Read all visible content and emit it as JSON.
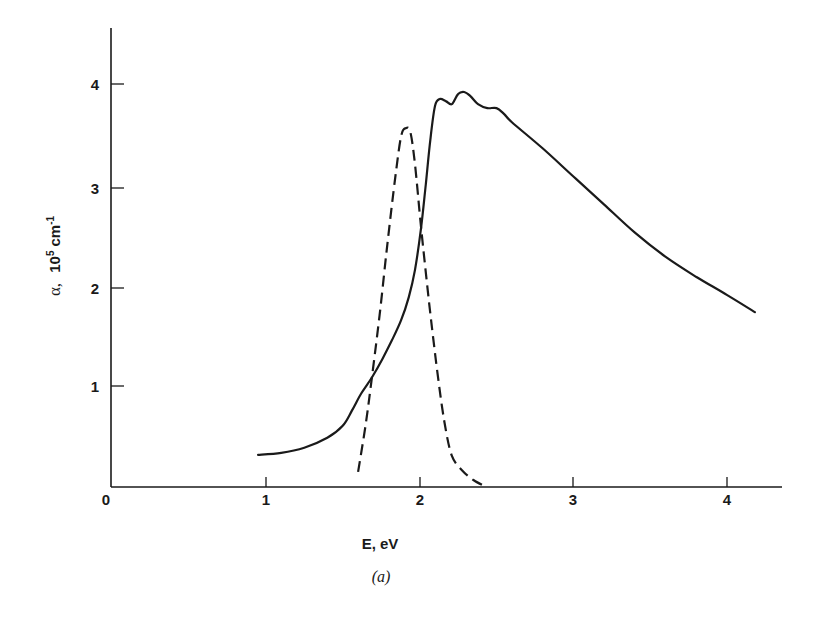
{
  "chart_data": {
    "type": "line",
    "title": "",
    "caption": "(a)",
    "xlabel": "E, eV",
    "ylabel": "α, 10⁵ cm⁻¹",
    "ylabel_parts": {
      "symbol": "α,",
      "base": "10",
      "exp1": "5",
      "unit": "cm",
      "exp2": "-1"
    },
    "xlim": [
      0,
      4.35
    ],
    "ylim": [
      0,
      4.5
    ],
    "x_ticks": [
      "0",
      "1",
      "2",
      "3",
      "4"
    ],
    "y_ticks": [
      "1",
      "2",
      "3",
      "4"
    ],
    "grid": false,
    "legend": null,
    "series": [
      {
        "name": "solid",
        "style": "solid",
        "points": [
          [
            0.95,
            0.31
          ],
          [
            1.1,
            0.33
          ],
          [
            1.25,
            0.38
          ],
          [
            1.4,
            0.48
          ],
          [
            1.5,
            0.6
          ],
          [
            1.56,
            0.75
          ],
          [
            1.62,
            0.92
          ],
          [
            1.69,
            1.08
          ],
          [
            1.76,
            1.27
          ],
          [
            1.82,
            1.45
          ],
          [
            1.88,
            1.65
          ],
          [
            1.93,
            1.88
          ],
          [
            1.97,
            2.15
          ],
          [
            2.01,
            2.57
          ],
          [
            2.04,
            3.0
          ],
          [
            2.07,
            3.45
          ],
          [
            2.1,
            3.78
          ],
          [
            2.13,
            3.85
          ],
          [
            2.17,
            3.83
          ],
          [
            2.21,
            3.8
          ],
          [
            2.25,
            3.9
          ],
          [
            2.29,
            3.92
          ],
          [
            2.33,
            3.88
          ],
          [
            2.38,
            3.8
          ],
          [
            2.44,
            3.76
          ],
          [
            2.5,
            3.76
          ],
          [
            2.55,
            3.7
          ],
          [
            2.6,
            3.62
          ],
          [
            2.8,
            3.36
          ],
          [
            3.0,
            3.08
          ],
          [
            3.2,
            2.8
          ],
          [
            3.4,
            2.52
          ],
          [
            3.6,
            2.28
          ],
          [
            3.8,
            2.08
          ],
          [
            4.0,
            1.9
          ],
          [
            4.18,
            1.73
          ]
        ]
      },
      {
        "name": "dashed",
        "style": "dashed",
        "points": [
          [
            1.6,
            0.14
          ],
          [
            1.65,
            0.62
          ],
          [
            1.69,
            1.08
          ],
          [
            1.74,
            1.7
          ],
          [
            1.79,
            2.4
          ],
          [
            1.84,
            3.05
          ],
          [
            1.88,
            3.48
          ],
          [
            1.91,
            3.56
          ],
          [
            1.94,
            3.52
          ],
          [
            1.97,
            3.2
          ],
          [
            2.01,
            2.57
          ],
          [
            2.06,
            1.85
          ],
          [
            2.11,
            1.2
          ],
          [
            2.16,
            0.65
          ],
          [
            2.21,
            0.3
          ],
          [
            2.28,
            0.15
          ],
          [
            2.35,
            0.06
          ],
          [
            2.42,
            0.0
          ]
        ]
      }
    ],
    "annotations": [
      "(a)"
    ]
  },
  "colors": {
    "ink": "#1a1a1a",
    "background": "#ffffff"
  }
}
